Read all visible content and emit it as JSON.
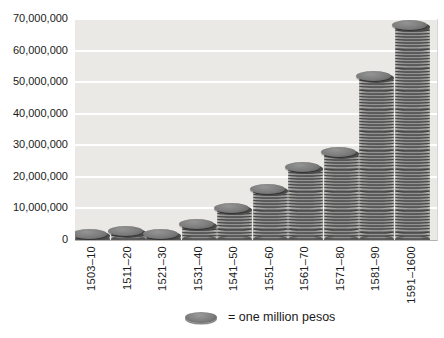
{
  "chart_data": {
    "type": "bar",
    "variant": "coin_stack_pictograph",
    "title": "",
    "categories": [
      "1503–10",
      "1511–20",
      "1521–30",
      "1531–40",
      "1541–50",
      "1551–60",
      "1561–70",
      "1571–80",
      "1581–90",
      "1591–1600"
    ],
    "values": [
      2,
      3,
      2,
      5,
      10,
      16,
      23,
      28,
      52,
      68
    ],
    "value_unit": "millions of pesos",
    "symbol_meaning": "one coin = one million pesos",
    "ylim": [
      0,
      70000000
    ],
    "y_ticks": [
      0,
      10000000,
      20000000,
      30000000,
      40000000,
      50000000,
      60000000,
      70000000
    ],
    "y_tick_labels": [
      "0",
      "10,000,000",
      "20,000,000",
      "30,000,000",
      "40,000,000",
      "50,000,000",
      "60,000,000",
      "70,000,000"
    ],
    "xlabel": "",
    "ylabel": "",
    "grid": true,
    "legend_text": "= one million pesos",
    "legend_position": "bottom-center"
  },
  "colors": {
    "plot_background": "#eae9e6",
    "gridline": "#ffffff",
    "coin_light": "#8b8b8b",
    "coin_dark": "#4b4b4b",
    "coin_top": "#7c7c7c",
    "text": "#1a1a1a"
  }
}
